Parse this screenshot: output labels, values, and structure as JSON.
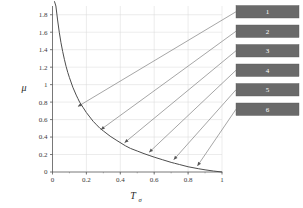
{
  "chart_data": {
    "type": "line",
    "title": "",
    "xlabel": "Tσ",
    "xlabel_main": "T",
    "xlabel_subscript": "σ",
    "ylabel": "μ",
    "xlim": [
      0,
      1
    ],
    "ylim": [
      0,
      1.9
    ],
    "grid": true,
    "grid_color": "#d9d9d9",
    "curve_color": "#4d4d4d",
    "leader_color": "#808080",
    "xticks": [
      0,
      0.2,
      0.4,
      0.6,
      0.8,
      1
    ],
    "xtick_labels": [
      "0",
      "0.2",
      "0.4",
      "0.6",
      "0.8",
      "1"
    ],
    "yticks": [
      0,
      0.2,
      0.4,
      0.6,
      0.8,
      1,
      1.2,
      1.4,
      1.6,
      1.8
    ],
    "ytick_labels": [
      "0",
      "0.2",
      "0.4",
      "0.6",
      "0.8",
      "1",
      "1.2",
      "1.4",
      "1.6",
      "1.8"
    ],
    "series": [
      {
        "name": "mu-curve",
        "description": "monotonically decreasing hyperbolic curve from large mu near T=0 down to mu=0 at T=1",
        "x": [
          0.012,
          0.02,
          0.03,
          0.04,
          0.05,
          0.06,
          0.07,
          0.08,
          0.09,
          0.1,
          0.12,
          0.14,
          0.15,
          0.16,
          0.18,
          0.2,
          0.22,
          0.24,
          0.26,
          0.28,
          0.3,
          0.34,
          0.38,
          0.43,
          0.46,
          0.5,
          0.54,
          0.57,
          0.6,
          0.65,
          0.7,
          0.72,
          0.75,
          0.8,
          0.86,
          0.9,
          0.95,
          1.0
        ],
        "y": [
          1.95,
          1.9,
          1.74,
          1.6,
          1.48,
          1.38,
          1.29,
          1.21,
          1.14,
          1.08,
          0.97,
          0.88,
          0.84,
          0.8,
          0.74,
          0.68,
          0.63,
          0.58,
          0.54,
          0.5,
          0.47,
          0.41,
          0.36,
          0.3,
          0.27,
          0.24,
          0.21,
          0.19,
          0.17,
          0.14,
          0.11,
          0.1,
          0.085,
          0.06,
          0.038,
          0.025,
          0.011,
          0.0
        ]
      }
    ],
    "annotations": [
      {
        "id": "1",
        "label": "1",
        "anchor_x": 0.15,
        "anchor_y": 0.75,
        "box_index": 0
      },
      {
        "id": "2",
        "label": "2",
        "anchor_x": 0.285,
        "anchor_y": 0.485,
        "box_index": 1
      },
      {
        "id": "3",
        "label": "3",
        "anchor_x": 0.425,
        "anchor_y": 0.335,
        "box_index": 2
      },
      {
        "id": "4",
        "label": "4",
        "anchor_x": 0.57,
        "anchor_y": 0.225,
        "box_index": 3
      },
      {
        "id": "5",
        "label": "5",
        "anchor_x": 0.715,
        "anchor_y": 0.14,
        "box_index": 4
      },
      {
        "id": "6",
        "label": "6",
        "anchor_x": 0.855,
        "anchor_y": 0.07,
        "box_index": 5
      }
    ],
    "legend": {
      "position": "right-outside",
      "box_fill": "#6a6a6a",
      "text_color": "#ffffff",
      "items": [
        {
          "label": "1"
        },
        {
          "label": "2"
        },
        {
          "label": "3"
        },
        {
          "label": "4"
        },
        {
          "label": "5"
        },
        {
          "label": "6"
        }
      ]
    }
  }
}
